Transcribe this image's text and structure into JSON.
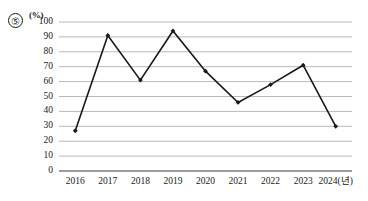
{
  "question_marker": "⑤",
  "chart_data": {
    "type": "line",
    "title": "",
    "xlabel": "2024(년)",
    "ylabel": "(%)",
    "x_axis_unit_label": "(년)",
    "categories": [
      "2016",
      "2017",
      "2018",
      "2019",
      "2020",
      "2021",
      "2022",
      "2023",
      "2024"
    ],
    "tick_labels": [
      "2016",
      "2017",
      "2018",
      "2019",
      "2020",
      "2021",
      "2022",
      "2023",
      "2024(년)"
    ],
    "values": [
      27,
      91,
      61,
      94,
      67,
      46,
      58,
      71,
      30
    ],
    "series": [
      {
        "name": "",
        "values": [
          27,
          91,
          61,
          94,
          67,
          46,
          58,
          71,
          30
        ]
      }
    ],
    "y_ticks": [
      0,
      10,
      20,
      30,
      40,
      50,
      60,
      70,
      80,
      90,
      100
    ],
    "y_tick_labels": [
      "0",
      "10",
      "20",
      "30",
      "40",
      "50",
      "60",
      "70",
      "80",
      "90",
      "100"
    ],
    "ylim": [
      0,
      100
    ],
    "grid": true,
    "grid_axis": "y",
    "legend": false,
    "legend_position": "none",
    "marker": "diamond",
    "line_color": "#1a1a1a",
    "grid_color": "#9b9b9b",
    "axis_color": "#3a3a3a",
    "background_color": "#ffffff"
  }
}
